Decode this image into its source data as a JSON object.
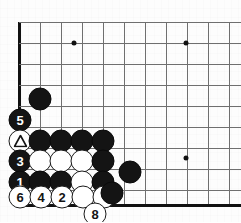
{
  "diagram": {
    "type": "go-board-problem",
    "board": {
      "grid_spacing": 21,
      "origin_x": 19,
      "origin_y": 22,
      "columns": 11,
      "rows": 10,
      "left_edge_x": 19,
      "bottom_edge_y": 204,
      "line_color": "#6f6f6f",
      "edge_color": "#111111",
      "background": "#fdfdfd"
    },
    "star_points": [
      {
        "name": "star-point-upper-left",
        "x": 74,
        "y": 43
      },
      {
        "name": "star-point-upper-right",
        "x": 186,
        "y": 43
      },
      {
        "name": "star-point-lower-right",
        "x": 186,
        "y": 158
      }
    ],
    "stones": [
      {
        "name": "black-stone-a",
        "color": "black",
        "x": 40,
        "y": 99,
        "label": ""
      },
      {
        "name": "black-stone-move-5",
        "color": "black",
        "x": 20,
        "y": 120,
        "label": "5"
      },
      {
        "name": "white-stone-marked-triangle",
        "color": "white",
        "x": 20,
        "y": 141,
        "label": "",
        "mark": "triangle"
      },
      {
        "name": "black-stone-b",
        "color": "black",
        "x": 40,
        "y": 141,
        "label": ""
      },
      {
        "name": "black-stone-c",
        "color": "black",
        "x": 61,
        "y": 141,
        "label": ""
      },
      {
        "name": "black-stone-d",
        "color": "black",
        "x": 82,
        "y": 141,
        "label": ""
      },
      {
        "name": "black-stone-e",
        "color": "black",
        "x": 103,
        "y": 141,
        "label": ""
      },
      {
        "name": "black-stone-move-3",
        "color": "black",
        "x": 20,
        "y": 161,
        "label": "3"
      },
      {
        "name": "white-stone-f",
        "color": "white",
        "x": 40,
        "y": 161,
        "label": ""
      },
      {
        "name": "white-stone-g",
        "color": "white",
        "x": 61,
        "y": 161,
        "label": ""
      },
      {
        "name": "white-stone-h",
        "color": "white",
        "x": 82,
        "y": 161,
        "label": ""
      },
      {
        "name": "black-stone-i",
        "color": "black",
        "x": 103,
        "y": 161,
        "label": ""
      },
      {
        "name": "black-stone-move-1",
        "color": "black",
        "x": 20,
        "y": 182,
        "label": "1"
      },
      {
        "name": "black-stone-j",
        "color": "black",
        "x": 40,
        "y": 182,
        "label": ""
      },
      {
        "name": "black-stone-k",
        "color": "black",
        "x": 61,
        "y": 182,
        "label": ""
      },
      {
        "name": "white-stone-l",
        "color": "white",
        "x": 82,
        "y": 182,
        "label": ""
      },
      {
        "name": "black-stone-m",
        "color": "black",
        "x": 103,
        "y": 182,
        "label": ""
      },
      {
        "name": "black-stone-n",
        "color": "black",
        "x": 130,
        "y": 172,
        "label": ""
      },
      {
        "name": "white-stone-move-6",
        "color": "white",
        "x": 20,
        "y": 197,
        "label": "6"
      },
      {
        "name": "white-stone-move-4",
        "color": "white",
        "x": 41,
        "y": 197,
        "label": "4"
      },
      {
        "name": "white-stone-move-2",
        "color": "white",
        "x": 62,
        "y": 197,
        "label": "2"
      },
      {
        "name": "white-stone-o",
        "color": "white",
        "x": 83,
        "y": 197,
        "label": ""
      },
      {
        "name": "white-stone-p",
        "color": "white",
        "x": 104,
        "y": 197,
        "label": ""
      },
      {
        "name": "black-stone-q",
        "color": "black",
        "x": 112,
        "y": 193,
        "label": ""
      },
      {
        "name": "white-stone-move-8",
        "color": "white",
        "x": 95,
        "y": 214,
        "label": "8"
      }
    ]
  }
}
